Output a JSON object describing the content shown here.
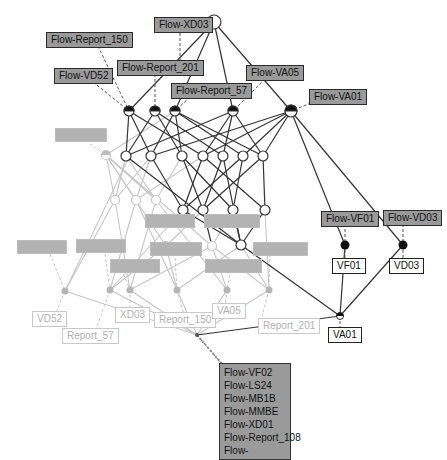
{
  "diagram": {
    "type": "concept-lattice",
    "colors": {
      "edge_dark": "#333333",
      "edge_faded": "#c4c4c4",
      "attr_label_bg": "#9a9a9a",
      "faded_label_bg": "#b3b3b3",
      "node_fill": "#ffffff",
      "node_dark_fill": "#111111"
    },
    "attribute_labels": [
      {
        "id": "flow-xd03",
        "text": "Flow-XD03"
      },
      {
        "id": "flow-report-150",
        "text": "Flow-Report_150"
      },
      {
        "id": "flow-report-201",
        "text": "Flow-Report_201"
      },
      {
        "id": "flow-vd52",
        "text": "Flow-VD52"
      },
      {
        "id": "flow-report-57",
        "text": "Flow-Report_57"
      },
      {
        "id": "flow-va05",
        "text": "Flow-VA05"
      },
      {
        "id": "flow-va01",
        "text": "Flow-VA01"
      },
      {
        "id": "flow-vf01",
        "text": "Flow-VF01"
      },
      {
        "id": "flow-vd03",
        "text": "Flow-VD03"
      }
    ],
    "object_labels": [
      {
        "id": "vf01",
        "text": "VF01"
      },
      {
        "id": "vd03",
        "text": "VD03"
      },
      {
        "id": "va01",
        "text": "VA01"
      }
    ],
    "faded_object_labels": [
      {
        "id": "vd52",
        "text": "VD52"
      },
      {
        "id": "report-57",
        "text": "Report_57"
      },
      {
        "id": "xd03",
        "text": "XD03"
      },
      {
        "id": "report-150",
        "text": "Report_150"
      },
      {
        "id": "va05",
        "text": "VA05"
      },
      {
        "id": "report-201",
        "text": "Report_201"
      }
    ],
    "bottom_label": {
      "lines": [
        "Flow-VF02",
        "Flow-LS24",
        "Flow-MB1B",
        "Flow-MMBE",
        "Flow-XD01",
        "Flow-Report_108",
        "Flow-"
      ]
    }
  }
}
